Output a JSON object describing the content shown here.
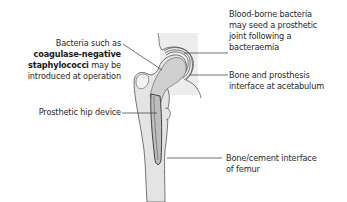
{
  "diagram": {
    "labels": {
      "bacteria_intro": {
        "line1": "Bacteria such as",
        "bold1": "coagulase-negative",
        "bold2": "staphylococci",
        "line3_suffix": " may be",
        "line4": "introduced at operation"
      },
      "blood_borne": {
        "line1": "Blood-borne bacteria",
        "line2": "may seed a prosthetic",
        "line3": "joint following a",
        "line4": "bacteraemia"
      },
      "acetabulum": {
        "line1": "Bone and prosthesis",
        "line2": "interface at acetabulum"
      },
      "hip_device": {
        "line1": "Prosthetic hip device"
      },
      "femur_interface": {
        "line1": "Bone/cement interface",
        "line2": "of femur"
      }
    },
    "colors": {
      "bone_fill": "#d9d9d9",
      "pelvis_bg": "#ececec",
      "outline": "#555555",
      "leader": "#333333",
      "shaft_fill": "#e6e6e6"
    }
  }
}
